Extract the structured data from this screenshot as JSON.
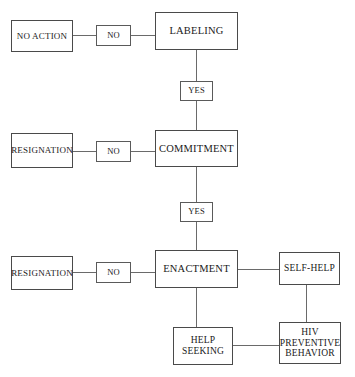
{
  "diagram": {
    "type": "flowchart",
    "background_color": "#ffffff",
    "line_color": "#6a6a6a",
    "box_border_color": "#4a4a4a",
    "nodes": {
      "no_action": "NO ACTION",
      "labeling": "LABELING",
      "resignation_commitment": "RESIGNATION",
      "commitment": "COMMITMENT",
      "resignation_enactment": "RESIGNATION",
      "enactment": "ENACTMENT",
      "self_help": "SELF-HELP",
      "help_seeking": "HELP\nSEEKING",
      "hiv_preventive_behavior": "HIV\nPREVENTIVE\nBEHAVIOR"
    },
    "edge_labels": {
      "no_labeling": "NO",
      "yes_labeling_commitment": "YES",
      "no_commitment": "NO",
      "yes_commitment_enactment": "YES",
      "no_enactment": "NO"
    }
  }
}
